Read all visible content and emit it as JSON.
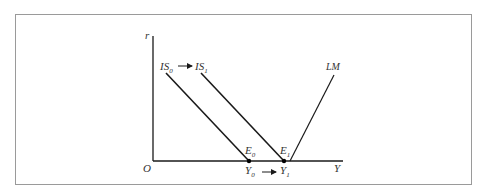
{
  "diagram": {
    "type": "IS-LM",
    "axes": {
      "y_label": "r",
      "x_label": "Y",
      "origin_label": "O"
    },
    "curves": [
      {
        "id": "IS0",
        "label": "IS",
        "subscript": "0"
      },
      {
        "id": "IS1",
        "label": "IS",
        "subscript": "1"
      },
      {
        "id": "LM",
        "label": "LM",
        "subscript": ""
      }
    ],
    "points": [
      {
        "id": "E0",
        "label": "E",
        "subscript": "0"
      },
      {
        "id": "E1",
        "label": "E",
        "subscript": "1"
      }
    ],
    "x_markers": [
      {
        "id": "Y0",
        "label": "Y",
        "subscript": "0"
      },
      {
        "id": "Y1",
        "label": "Y",
        "subscript": "1"
      }
    ],
    "colors": {
      "line": "#1a1a1a",
      "frame": "#9a9a9a",
      "text": "#333333"
    }
  }
}
